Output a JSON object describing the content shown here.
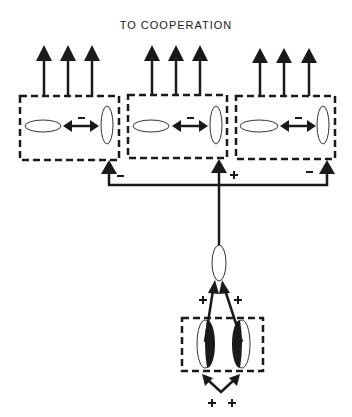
{
  "title": "TO COOPERATION",
  "colors": {
    "ink": "#1a1a1a",
    "background": "#ffffff"
  },
  "top_modules": [
    {
      "id": "left",
      "internal_link_sign": "−",
      "feedback_sign": "−"
    },
    {
      "id": "middle",
      "internal_link_sign": "−",
      "feedback_sign": "+"
    },
    {
      "id": "right",
      "internal_link_sign": "−",
      "feedback_sign": "−"
    }
  ],
  "output_arrows_per_module": 3,
  "hub": {
    "label": ""
  },
  "bottom_module": {
    "hub_input_signs": [
      "+",
      "+"
    ],
    "external_input_signs": [
      "+",
      "+"
    ]
  }
}
